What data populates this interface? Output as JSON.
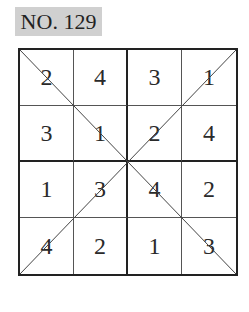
{
  "puzzle": {
    "number_label": "NO. 129",
    "type": "4x4 diagonal sudoku",
    "grid": [
      [
        "2",
        "4",
        "3",
        "1"
      ],
      [
        "3",
        "1",
        "2",
        "4"
      ],
      [
        "1",
        "3",
        "4",
        "2"
      ],
      [
        "4",
        "2",
        "1",
        "3"
      ]
    ]
  },
  "colors": {
    "label_background": "#d0d0d0",
    "grid_line": "#222222",
    "text": "#2a2a2a"
  }
}
